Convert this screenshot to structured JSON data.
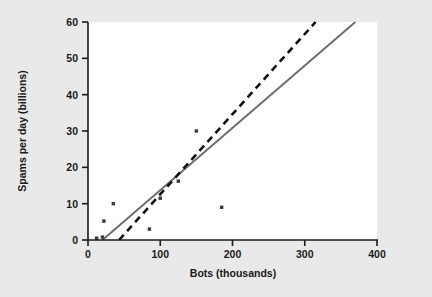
{
  "chart_data": {
    "type": "scatter",
    "title": "",
    "xlabel": "Bots (thousands)",
    "ylabel": "Spams per day (billions)",
    "xlim": [
      0,
      400
    ],
    "ylim": [
      0,
      60
    ],
    "xticks": [
      0,
      100,
      200,
      300,
      400
    ],
    "yticks": [
      0,
      10,
      20,
      30,
      40,
      50,
      60
    ],
    "xtick_labels": [
      "0",
      "100",
      "200",
      "300",
      "400"
    ],
    "ytick_labels": [
      "0",
      "10",
      "20",
      "30",
      "40",
      "50",
      "60"
    ],
    "grid": false,
    "legend": "none",
    "points": [
      {
        "x": 12,
        "y": 0.5
      },
      {
        "x": 20,
        "y": 0.8
      },
      {
        "x": 22,
        "y": 5.2
      },
      {
        "x": 35,
        "y": 10.0
      },
      {
        "x": 85,
        "y": 3.0
      },
      {
        "x": 100,
        "y": 11.5
      },
      {
        "x": 125,
        "y": 16.2
      },
      {
        "x": 150,
        "y": 30.0
      },
      {
        "x": 185,
        "y": 9.0
      }
    ],
    "series": [
      {
        "name": "solid-fit-line",
        "style": "solid",
        "color": "#6e6e6e",
        "x": [
          20,
          370
        ],
        "y": [
          0,
          60
        ]
      },
      {
        "name": "dashed-fit-line",
        "style": "dashed",
        "color": "#111111",
        "x": [
          43,
          315
        ],
        "y": [
          0,
          60
        ]
      }
    ]
  },
  "figure": {
    "background_color": "#e9e9e9",
    "plot_background_color": "#ffffff",
    "point_color": "#3a3a3a",
    "axis_color": "#1a1a1a"
  }
}
